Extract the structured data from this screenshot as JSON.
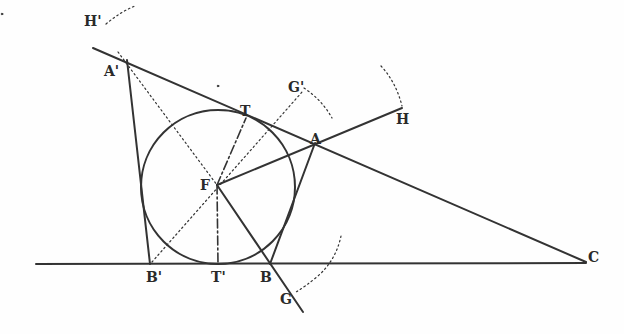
{
  "diagram": {
    "type": "geometric-construction",
    "stroke_color": "#333333",
    "labels": {
      "H_prime": "H'",
      "A_prime": "A'",
      "T": "T",
      "G_prime": "G'",
      "A": "A",
      "H": "H",
      "F": "F",
      "B_prime": "B'",
      "T_prime": "T'",
      "B": "B",
      "G": "G",
      "C": "C"
    },
    "points": {
      "H_prime": [
        106,
        22
      ],
      "A_prime": [
        118,
        58
      ],
      "T": [
        246,
        118
      ],
      "G_prime": [
        302,
        92
      ],
      "A": [
        314,
        144
      ],
      "H": [
        403,
        110
      ],
      "F": [
        217,
        185
      ],
      "B_prime": [
        150,
        264
      ],
      "T_prime": [
        218,
        264
      ],
      "B": [
        269,
        264
      ],
      "G": [
        290,
        292
      ],
      "C": [
        584,
        261
      ]
    },
    "circle": {
      "center": [
        218,
        187
      ],
      "radius": 77
    }
  }
}
